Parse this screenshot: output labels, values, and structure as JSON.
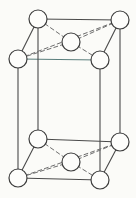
{
  "figure": {
    "background_color": "#fbfbf8",
    "canvas": {
      "width": 136,
      "height": 198
    }
  },
  "style": {
    "edge_color": "#4a4a4a",
    "edge_color_front_top": "#5b7f7d",
    "hidden_edge_color": "#6e6e6e",
    "atom_fill": "#fdfdfb",
    "atom_stroke": "#3d3d3d",
    "edge_width": 1.1,
    "hidden_edge_width": 1.0,
    "atom_stroke_width": 1.2,
    "atom_radius": 9,
    "dash_pattern": "4 3"
  },
  "chart_data": {
    "type": "scatter",
    "xlabel": "",
    "ylabel": "",
    "projection": "oblique",
    "atoms": [
      {
        "id": "top-back-left",
        "label": "top back left corner",
        "x": 38,
        "y": 19,
        "face": "top",
        "role": "corner"
      },
      {
        "id": "top-back-right",
        "label": "top back right corner",
        "x": 120,
        "y": 20,
        "face": "top",
        "role": "corner"
      },
      {
        "id": "top-front-left",
        "label": "top front left corner",
        "x": 18,
        "y": 59,
        "face": "top",
        "role": "corner"
      },
      {
        "id": "top-front-right",
        "label": "top front right corner",
        "x": 100,
        "y": 60,
        "face": "top",
        "role": "corner"
      },
      {
        "id": "top-face-center",
        "label": "top face centre atom",
        "x": 71,
        "y": 42,
        "face": "top",
        "role": "face-center"
      },
      {
        "id": "bot-back-left",
        "label": "bottom back left corner",
        "x": 38,
        "y": 139,
        "face": "bottom",
        "role": "corner"
      },
      {
        "id": "bot-back-right",
        "label": "bottom back right corner",
        "x": 120,
        "y": 142,
        "face": "bottom",
        "role": "corner"
      },
      {
        "id": "bot-front-left",
        "label": "bottom front left corner",
        "x": 18,
        "y": 178,
        "face": "bottom",
        "role": "corner"
      },
      {
        "id": "bot-front-right",
        "label": "bottom front right corner",
        "x": 100,
        "y": 180,
        "face": "bottom",
        "role": "corner"
      },
      {
        "id": "bot-face-center",
        "label": "bottom face centre atom",
        "x": 71,
        "y": 162,
        "face": "bottom",
        "role": "face-center"
      }
    ],
    "solid_edges": [
      {
        "id": "top-back-edge",
        "from": "top-back-left",
        "to": "top-back-right",
        "tint": "normal"
      },
      {
        "id": "top-left-edge",
        "from": "top-back-left",
        "to": "top-front-left",
        "tint": "normal"
      },
      {
        "id": "top-right-edge",
        "from": "top-back-right",
        "to": "top-front-right",
        "tint": "normal"
      },
      {
        "id": "top-front-edge",
        "from": "top-front-left",
        "to": "top-front-right",
        "tint": "teal"
      },
      {
        "id": "bottom-back-edge",
        "from": "bot-back-left",
        "to": "bot-back-right",
        "tint": "normal"
      },
      {
        "id": "bottom-left-edge",
        "from": "bot-back-left",
        "to": "bot-front-left",
        "tint": "normal"
      },
      {
        "id": "bottom-right-edge",
        "from": "bot-back-right",
        "to": "bot-front-right",
        "tint": "normal"
      },
      {
        "id": "bottom-front-edge",
        "from": "bot-front-left",
        "to": "bot-front-right",
        "tint": "normal"
      },
      {
        "id": "vertical-back-left",
        "from": "top-back-left",
        "to": "bot-back-left",
        "tint": "normal"
      },
      {
        "id": "vertical-back-right",
        "from": "top-back-right",
        "to": "bot-back-right",
        "tint": "normal"
      },
      {
        "id": "vertical-front-left",
        "from": "top-front-left",
        "to": "bot-front-left",
        "tint": "normal"
      },
      {
        "id": "vertical-front-right",
        "from": "top-front-right",
        "to": "bot-front-right",
        "tint": "normal"
      }
    ],
    "dashed_edges": [
      {
        "id": "top-diagonal",
        "from": "top-front-left",
        "to": "top-back-right"
      },
      {
        "id": "top-center-to-bl",
        "from": "top-face-center",
        "to": "top-back-left"
      },
      {
        "id": "top-center-to-br",
        "from": "top-face-center",
        "to": "top-back-right"
      },
      {
        "id": "top-center-to-fl",
        "from": "top-face-center",
        "to": "top-front-left"
      },
      {
        "id": "top-center-to-fr",
        "from": "top-face-center",
        "to": "top-front-right"
      },
      {
        "id": "bottom-diagonal",
        "from": "bot-front-left",
        "to": "bot-back-right"
      },
      {
        "id": "bottom-center-to-bl",
        "from": "bot-face-center",
        "to": "bot-back-left"
      },
      {
        "id": "bottom-center-to-br",
        "from": "bot-face-center",
        "to": "bot-back-right"
      },
      {
        "id": "bottom-center-to-fl",
        "from": "bot-face-center",
        "to": "bot-front-left"
      },
      {
        "id": "bottom-center-to-fr",
        "from": "bot-face-center",
        "to": "bot-front-right"
      }
    ],
    "counts": {
      "corner_atoms": 8,
      "face_center_atoms": 2,
      "total_atoms": 10,
      "solid_edges": 12,
      "dashed_edges": 10
    }
  }
}
